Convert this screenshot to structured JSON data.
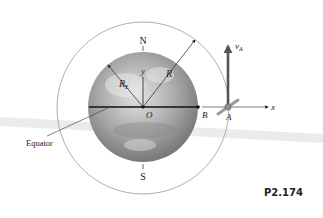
{
  "figure": {
    "id_label": "P2.174",
    "labels": {
      "north": "N",
      "south": "S",
      "origin": "O",
      "point_b": "B",
      "point_a": "A",
      "x_axis": "x",
      "y_axis": "y",
      "earth_radius": "R",
      "earth_radius_sub": "E",
      "orbit_radius": "R",
      "velocity": "v",
      "velocity_sub": "A",
      "equator": "Equator"
    },
    "colors": {
      "orbit": "#9a9a9a",
      "earth_light": "#d8d8d8",
      "earth_dark": "#7a7a7a",
      "axis": "#222222",
      "velocity_arrow": "#555555",
      "satellite": "#8a8a8a",
      "equator_band": "#e6e6e6"
    }
  }
}
